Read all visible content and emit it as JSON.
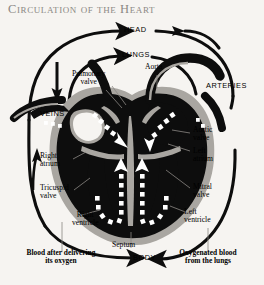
{
  "title": "Circulation of the Heart",
  "colors": {
    "background": "#f6f4f1",
    "title": "#8b8884",
    "heart_dark": "#0d0d0d",
    "heart_wall": "#a9a6a1",
    "flow_arrow": "#ffffff",
    "label": "#000000",
    "leader": "#8b8884"
  },
  "diagram": {
    "type": "anatomical-flow-diagram"
  },
  "circuit_labels": [
    {
      "id": "head",
      "text": "HEAD",
      "style": "caps"
    },
    {
      "id": "lungs",
      "text": "LUNGS",
      "style": "caps"
    },
    {
      "id": "veins",
      "text": "VEINS",
      "style": "caps"
    },
    {
      "id": "arteries",
      "text": "ARTERIES",
      "style": "caps"
    },
    {
      "id": "body",
      "text": "BODY",
      "style": "caps"
    }
  ],
  "anatomy_labels": [
    {
      "id": "pulmonary-valve",
      "text": "Pulmonary\nvalve"
    },
    {
      "id": "aorta",
      "text": "Aorta"
    },
    {
      "id": "aortic-valve",
      "text": "Aortic\nvalve"
    },
    {
      "id": "right-atrium",
      "text": "Right\natrium"
    },
    {
      "id": "left-atrium",
      "text": "Left\natrium"
    },
    {
      "id": "tricuspid-valve",
      "text": "Tricuspid\nvalve"
    },
    {
      "id": "mitral-valve",
      "text": "Mitral\nvalve"
    },
    {
      "id": "right-ventricle",
      "text": "Right\nventricle"
    },
    {
      "id": "left-ventricle",
      "text": "Left\nventricle"
    },
    {
      "id": "septum",
      "text": "Septum"
    }
  ],
  "annotations": [
    {
      "id": "deoxygenated",
      "line1": "Blood after delivering",
      "line2": "its oxygen"
    },
    {
      "id": "oxygenated",
      "line1": "Oxygenated blood",
      "line2": "from the lungs"
    }
  ],
  "labels": {
    "head": "HEAD",
    "lungs": "LUNGS",
    "veins": "VEINS",
    "arteries": "ARTERIES",
    "body": "BODY",
    "aorta": "Aorta",
    "septum": "Septum",
    "pulmonary_valve_l1": "Pulmonary",
    "pulmonary_valve_l2": "valve",
    "aortic_valve_l1": "Aortic",
    "aortic_valve_l2": "valve",
    "right_atrium_l1": "Right",
    "right_atrium_l2": "atrium",
    "left_atrium_l1": "Left",
    "left_atrium_l2": "atrium",
    "tricuspid_l1": "Tricuspid",
    "tricuspid_l2": "valve",
    "mitral_l1": "Mitral",
    "mitral_l2": "valve",
    "right_ventricle_l1": "Right",
    "right_ventricle_l2": "ventricle",
    "left_ventricle_l1": "Left",
    "left_ventricle_l2": "ventricle",
    "deoxy_l1": "Blood after delivering",
    "deoxy_l2": "its oxygen",
    "oxy_l1": "Oxygenated blood",
    "oxy_l2": "from the lungs"
  }
}
